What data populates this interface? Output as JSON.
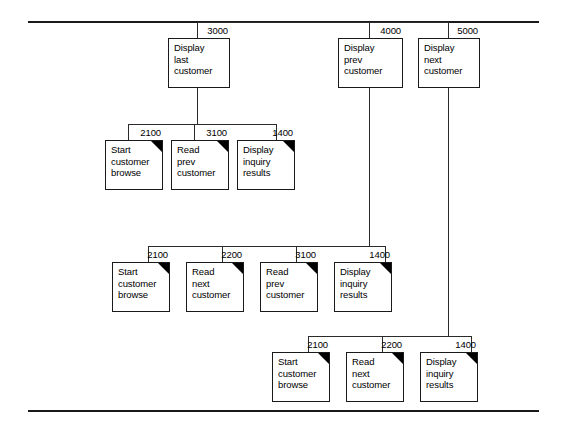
{
  "diagram": {
    "type": "structure-chart",
    "title_visible": false,
    "rules": [
      {
        "name": "top-rule"
      },
      {
        "name": "bottom-rule"
      }
    ],
    "modules": [
      {
        "id": "3000",
        "lines": "Display\nlast\ncustomer",
        "flag": false,
        "row": 1,
        "x": 168,
        "y": 38,
        "w": 62,
        "h": 50
      },
      {
        "id": "4000",
        "lines": "Display\nprev\ncustomer",
        "flag": false,
        "row": 1,
        "x": 338,
        "y": 38,
        "w": 65,
        "h": 50
      },
      {
        "id": "5000",
        "lines": "Display\nnext\ncustomer",
        "flag": false,
        "row": 1,
        "x": 418,
        "y": 38,
        "w": 62,
        "h": 50
      },
      {
        "id": "2100",
        "lines": "Start\ncustomer\nbrowse",
        "flag": true,
        "row": 2,
        "x": 105,
        "y": 140,
        "w": 58,
        "h": 50
      },
      {
        "id": "3100",
        "lines": "Read\nprev\ncustomer",
        "flag": true,
        "row": 2,
        "x": 171,
        "y": 140,
        "w": 58,
        "h": 50
      },
      {
        "id": "1400",
        "lines": "Display\ninquiry\nresults",
        "flag": true,
        "row": 2,
        "x": 237,
        "y": 140,
        "w": 58,
        "h": 50
      },
      {
        "id": "2100",
        "lines": "Start\ncustomer\nbrowse",
        "flag": true,
        "row": 3,
        "x": 112,
        "y": 262,
        "w": 58,
        "h": 50
      },
      {
        "id": "2200",
        "lines": "Read\nnext\ncustomer",
        "flag": true,
        "row": 3,
        "x": 186,
        "y": 262,
        "w": 58,
        "h": 50
      },
      {
        "id": "3100",
        "lines": "Read\nprev\ncustomer",
        "flag": true,
        "row": 3,
        "x": 260,
        "y": 262,
        "w": 58,
        "h": 50
      },
      {
        "id": "1400",
        "lines": "Display\ninquiry\nresults",
        "flag": true,
        "row": 3,
        "x": 334,
        "y": 262,
        "w": 58,
        "h": 50
      },
      {
        "id": "2100",
        "lines": "Start\ncustomer\nbrowse",
        "flag": true,
        "row": 4,
        "x": 272,
        "y": 352,
        "w": 58,
        "h": 50
      },
      {
        "id": "2200",
        "lines": "Read\nnext\ncustomer",
        "flag": true,
        "row": 4,
        "x": 346,
        "y": 352,
        "w": 58,
        "h": 50
      },
      {
        "id": "1400",
        "lines": "Display\ninquiry\nresults",
        "flag": true,
        "row": 4,
        "x": 420,
        "y": 352,
        "w": 58,
        "h": 50
      }
    ],
    "connectors": {
      "h": [
        {
          "name": "root-bus",
          "x": 197,
          "y": 22,
          "w": 252
        },
        {
          "name": "row2-bus",
          "x": 128,
          "y": 124,
          "w": 148
        },
        {
          "name": "row3-bus",
          "x": 148,
          "y": 246,
          "w": 237
        },
        {
          "name": "row4-bus",
          "x": 308,
          "y": 336,
          "w": 163
        }
      ],
      "v": [
        {
          "name": "drop-3000-top",
          "x": 197,
          "y": 22,
          "h": 16
        },
        {
          "name": "drop-4000-top",
          "x": 369,
          "y": 22,
          "h": 16
        },
        {
          "name": "drop-5000-top",
          "x": 448,
          "y": 22,
          "h": 16
        },
        {
          "name": "stem-3000",
          "x": 197,
          "y": 88,
          "h": 36
        },
        {
          "name": "stem-4000",
          "x": 369,
          "y": 88,
          "h": 158
        },
        {
          "name": "stem-5000",
          "x": 448,
          "y": 88,
          "h": 248
        },
        {
          "name": "row2-drop-a",
          "x": 128,
          "y": 124,
          "h": 16
        },
        {
          "name": "row2-drop-b",
          "x": 194,
          "y": 124,
          "h": 16
        },
        {
          "name": "row2-drop-c",
          "x": 276,
          "y": 124,
          "h": 16
        },
        {
          "name": "row3-drop-a",
          "x": 148,
          "y": 246,
          "h": 16
        },
        {
          "name": "row3-drop-b",
          "x": 222,
          "y": 246,
          "h": 16
        },
        {
          "name": "row3-drop-c",
          "x": 296,
          "y": 246,
          "h": 16
        },
        {
          "name": "row3-drop-d",
          "x": 385,
          "y": 246,
          "h": 16
        },
        {
          "name": "row4-drop-a",
          "x": 308,
          "y": 336,
          "h": 16
        },
        {
          "name": "row4-drop-b",
          "x": 382,
          "y": 336,
          "h": 16
        },
        {
          "name": "row4-drop-c",
          "x": 471,
          "y": 336,
          "h": 16
        }
      ]
    }
  }
}
